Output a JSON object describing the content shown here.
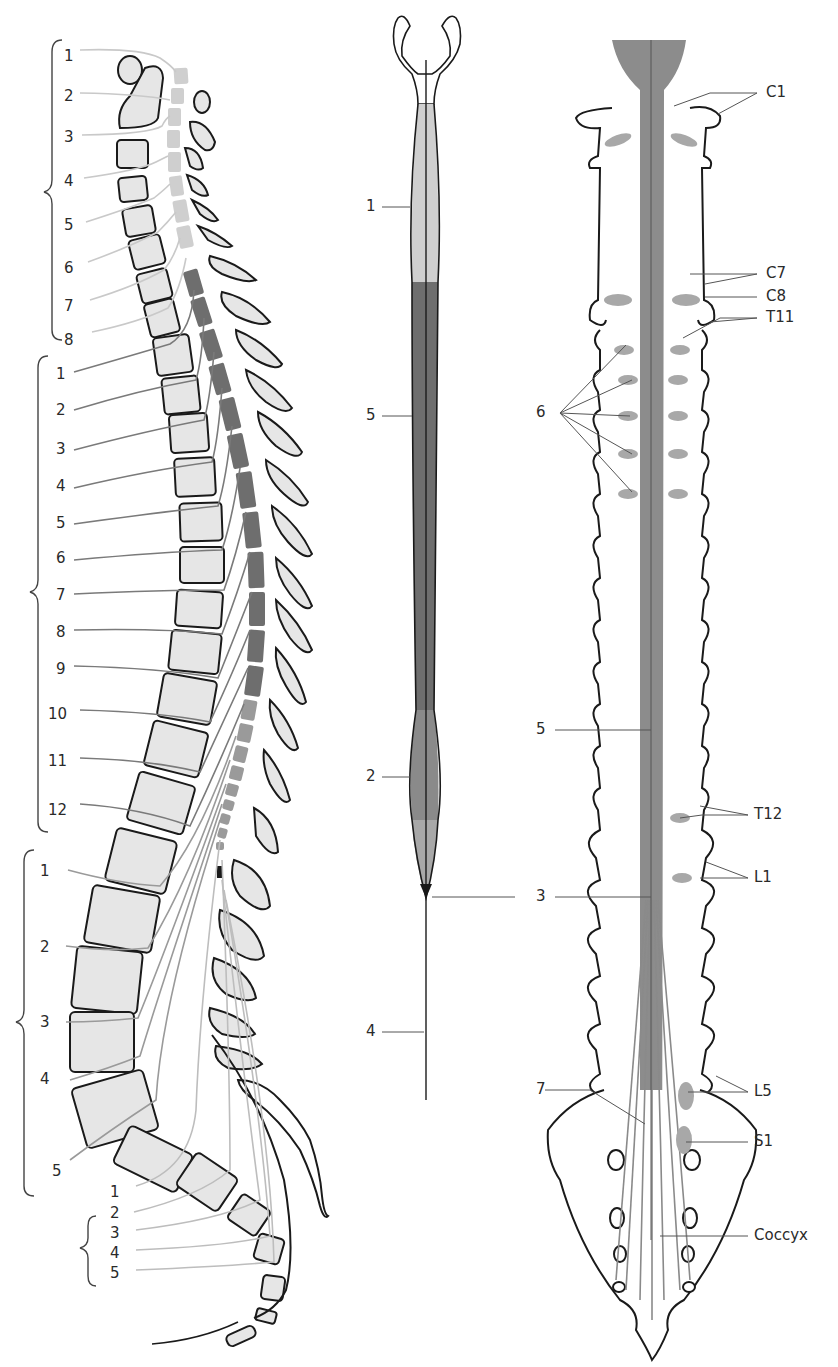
{
  "colors": {
    "cervical_segment": "#cfcfcf",
    "thoracic_segment": "#6e6e6e",
    "lumbosacral_segment": "#9a9a9a",
    "bone_fill": "#e6e6e6",
    "outline": "#1a1a1a",
    "nerve": "#9a9a9a",
    "root_gray": "#8c8c8c"
  },
  "lateral_view": {
    "cervical_labels": [
      "1",
      "2",
      "3",
      "4",
      "5",
      "6",
      "7",
      "8"
    ],
    "thoracic_labels": [
      "1",
      "2",
      "3",
      "4",
      "5",
      "6",
      "7",
      "8",
      "9",
      "10",
      "11",
      "12"
    ],
    "lumbar_labels": [
      "1",
      "2",
      "3",
      "4",
      "5"
    ],
    "sacral_labels": [
      "1",
      "2",
      "3",
      "4",
      "5"
    ]
  },
  "cord_view": {
    "labels": {
      "cervical_enlargement": "1",
      "thoracic_cord": "5",
      "lumbar_enlargement": "2",
      "conus": "3",
      "filum": "4"
    }
  },
  "posterior_view": {
    "labels": {
      "c1": "C1",
      "c7": "C7",
      "c8": "C8",
      "t11": "T11",
      "ganglia": "6",
      "cord": "5",
      "t12": "T12",
      "l1": "L1",
      "conus": "3",
      "cauda": "7",
      "l5": "L5",
      "s1": "S1",
      "coccyx": "Coccyx"
    }
  }
}
